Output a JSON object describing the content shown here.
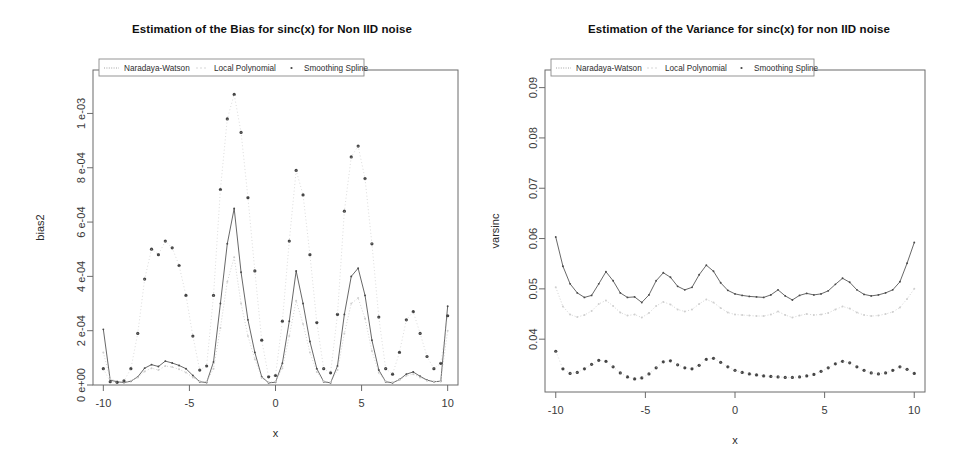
{
  "figure": {
    "background": "#ffffff",
    "panel_count": 2,
    "series_colors": {
      "naradaya_watson": "#4d4d4d",
      "local_polynomial": "#c8c8c8",
      "smoothing_spline": "#434343"
    }
  },
  "legend": {
    "entries": [
      {
        "label": "Naradaya-Watson",
        "glyph": "dotted-line",
        "key": "nw"
      },
      {
        "label": "Local Polynomial",
        "glyph": "faint-dashed-line",
        "key": "lp"
      },
      {
        "label": "Smoothing Spline",
        "glyph": "dot-marker",
        "key": "ss"
      }
    ],
    "position": "top-left-inside"
  },
  "chart_data": [
    {
      "id": "bias-plot",
      "type": "line",
      "title": "Estimation of the Bias for sinc(x) for Non IID noise",
      "xlabel": "x",
      "ylabel": "bias2",
      "xlim": [
        -10.6,
        10.6
      ],
      "ylim": [
        0,
        0.00116
      ],
      "grid": false,
      "xticks": [
        -10,
        -5,
        0,
        5,
        10
      ],
      "xticklabels": [
        "-10",
        "-5",
        "0",
        "5",
        "10"
      ],
      "yticks": [
        0,
        0.0002,
        0.0004,
        0.0006,
        0.0008,
        0.001
      ],
      "yticklabels": [
        "0 e+00",
        "2 e-04",
        "4 e-04",
        "6 e-04",
        "8 e-04",
        "1 e-03"
      ],
      "legend_position": "top-left",
      "x": [
        -10.0,
        -9.6,
        -9.2,
        -8.8,
        -8.4,
        -8.0,
        -7.6,
        -7.2,
        -6.8,
        -6.4,
        -6.0,
        -5.6,
        -5.2,
        -4.8,
        -4.4,
        -4.0,
        -3.6,
        -3.2,
        -2.8,
        -2.4,
        -2.0,
        -1.6,
        -1.2,
        -0.8,
        -0.4,
        0.0,
        0.4,
        0.8,
        1.2,
        1.6,
        2.0,
        2.4,
        2.8,
        3.2,
        3.6,
        4.0,
        4.4,
        4.8,
        5.2,
        5.6,
        6.0,
        6.4,
        6.8,
        7.2,
        7.6,
        8.0,
        8.4,
        8.8,
        9.2,
        9.6,
        10.0
      ],
      "series": [
        {
          "name": "Naradaya-Watson",
          "key": "nw",
          "style": "line-with-small-dots",
          "values": [
            0.000205,
            1.8e-05,
            1.2e-05,
            9e-06,
            1.4e-05,
            3e-05,
            6.2e-05,
            7.5e-05,
            6.8e-05,
            8.8e-05,
            8.1e-05,
            7.2e-05,
            6e-05,
            3.5e-05,
            1.2e-05,
            9e-06,
            8.5e-05,
            0.0003,
            0.00052,
            0.00065,
            0.000415,
            0.00024,
            0.00012,
            3e-05,
            8e-06,
            1e-05,
            8e-05,
            0.000235,
            0.00042,
            0.0003,
            0.00016,
            6e-05,
            1.2e-05,
            8e-06,
            7e-05,
            0.00026,
            0.0004,
            0.00043,
            0.00033,
            0.000165,
            5.5e-05,
            1.2e-05,
            8e-06,
            2e-05,
            4e-05,
            4.8e-05,
            3.2e-05,
            1.8e-05,
            1.2e-05,
            1.4e-05,
            0.00029
          ]
        },
        {
          "name": "Local Polynomial",
          "key": "lp",
          "style": "faint-dotted",
          "values": [
            0.00012,
            2.2e-05,
            1.4e-05,
            1e-05,
            1.6e-05,
            2.8e-05,
            5e-05,
            6.2e-05,
            5.5e-05,
            7e-05,
            6.6e-05,
            5.8e-05,
            4.6e-05,
            2.8e-05,
            1.4e-05,
            1.2e-05,
            6e-05,
            0.00021,
            0.00038,
            0.00047,
            0.0003,
            0.00018,
            9.5e-05,
            2.6e-05,
            1e-05,
            1.2e-05,
            6.2e-05,
            0.00018,
            0.00031,
            0.000225,
            0.00012,
            4.8e-05,
            1.4e-05,
            1e-05,
            5.5e-05,
            0.00019,
            0.0003,
            0.00032,
            0.000245,
            0.000125,
            4.5e-05,
            1.4e-05,
            1e-05,
            1.8e-05,
            3.4e-05,
            4e-05,
            2.8e-05,
            1.6e-05,
            1.2e-05,
            1.4e-05,
            0.0002
          ]
        },
        {
          "name": "Smoothing Spline",
          "key": "ss",
          "style": "large-dots",
          "values": [
            6e-05,
            1.2e-05,
            1e-05,
            1.5e-05,
            6e-05,
            0.00019,
            0.00039,
            0.0005,
            0.00048,
            0.00053,
            0.000505,
            0.00044,
            0.00033,
            0.00018,
            5.5e-05,
            7e-05,
            0.00033,
            0.00072,
            0.00098,
            0.00107,
            0.00093,
            0.00069,
            0.00042,
            0.000165,
            3e-05,
            3.5e-05,
            0.000235,
            0.00053,
            0.00079,
            0.0007,
            0.00048,
            0.00023,
            6e-05,
            4.5e-05,
            0.00026,
            0.00064,
            0.00084,
            0.00088,
            0.00076,
            0.00052,
            0.00025,
            6e-05,
            4e-05,
            0.00012,
            0.00024,
            0.00027,
            0.00019,
            0.000105,
            6e-05,
            8e-05,
            0.000255
          ]
        }
      ]
    },
    {
      "id": "variance-plot",
      "type": "line",
      "title": "Estimation of the Variance for sinc(x) for non IID noise",
      "xlabel": "x",
      "ylabel": "varsinc",
      "xlim": [
        -10.6,
        10.6
      ],
      "ylim": [
        0.0295,
        0.0935
      ],
      "grid": false,
      "xticks": [
        -10,
        -5,
        0,
        5,
        10
      ],
      "xticklabels": [
        "-10",
        "-5",
        "0",
        "5",
        "10"
      ],
      "yticks": [
        0.04,
        0.05,
        0.06,
        0.07,
        0.08,
        0.09
      ],
      "yticklabels": [
        "0.04",
        "0.05",
        "0.06",
        "0.07",
        "0.08",
        "0.09"
      ],
      "legend_position": "top-left",
      "x": [
        -10.0,
        -9.6,
        -9.2,
        -8.8,
        -8.4,
        -8.0,
        -7.6,
        -7.2,
        -6.8,
        -6.4,
        -6.0,
        -5.6,
        -5.2,
        -4.8,
        -4.4,
        -4.0,
        -3.6,
        -3.2,
        -2.8,
        -2.4,
        -2.0,
        -1.6,
        -1.2,
        -0.8,
        -0.4,
        0.0,
        0.4,
        0.8,
        1.2,
        1.6,
        2.0,
        2.4,
        2.8,
        3.2,
        3.6,
        4.0,
        4.4,
        4.8,
        5.2,
        5.6,
        6.0,
        6.4,
        6.8,
        7.2,
        7.6,
        8.0,
        8.4,
        8.8,
        9.2,
        9.6,
        10.0
      ],
      "series": [
        {
          "name": "Naradaya-Watson",
          "key": "nw",
          "style": "line-with-small-dots",
          "values": [
            0.0603,
            0.0545,
            0.051,
            0.0492,
            0.0483,
            0.0487,
            0.051,
            0.0534,
            0.0516,
            0.0492,
            0.0483,
            0.0484,
            0.0473,
            0.0488,
            0.0516,
            0.0532,
            0.0523,
            0.0505,
            0.0498,
            0.0503,
            0.0528,
            0.0547,
            0.0535,
            0.0512,
            0.0497,
            0.049,
            0.0487,
            0.0485,
            0.0484,
            0.0483,
            0.0488,
            0.0498,
            0.0486,
            0.0478,
            0.0487,
            0.0491,
            0.0488,
            0.049,
            0.0496,
            0.0509,
            0.0521,
            0.0513,
            0.0498,
            0.0489,
            0.0486,
            0.0488,
            0.0492,
            0.0498,
            0.0514,
            0.0551,
            0.0592
          ]
        },
        {
          "name": "Local Polynomial",
          "key": "lp",
          "style": "faint-dotted",
          "values": [
            0.0503,
            0.0465,
            0.0449,
            0.0444,
            0.0448,
            0.0456,
            0.047,
            0.0477,
            0.0466,
            0.0453,
            0.0447,
            0.0449,
            0.0443,
            0.0452,
            0.0466,
            0.0474,
            0.0469,
            0.0459,
            0.0455,
            0.0459,
            0.047,
            0.0479,
            0.0473,
            0.0462,
            0.0453,
            0.0449,
            0.0448,
            0.0447,
            0.0446,
            0.0446,
            0.0449,
            0.0455,
            0.0448,
            0.0443,
            0.0447,
            0.045,
            0.0448,
            0.0449,
            0.0452,
            0.0459,
            0.0465,
            0.0461,
            0.0453,
            0.0448,
            0.0446,
            0.0447,
            0.045,
            0.0454,
            0.0463,
            0.048,
            0.05
          ]
        },
        {
          "name": "Smoothing Spline",
          "key": "ss",
          "style": "large-dots",
          "values": [
            0.0376,
            0.0341,
            0.0332,
            0.0334,
            0.0341,
            0.035,
            0.0358,
            0.0356,
            0.0345,
            0.0333,
            0.0325,
            0.0321,
            0.0323,
            0.0331,
            0.0343,
            0.0355,
            0.0357,
            0.0349,
            0.0343,
            0.0341,
            0.0348,
            0.036,
            0.0362,
            0.0354,
            0.0345,
            0.0338,
            0.0334,
            0.0331,
            0.0329,
            0.0327,
            0.0326,
            0.0325,
            0.0324,
            0.0324,
            0.0325,
            0.0327,
            0.033,
            0.0336,
            0.0343,
            0.0351,
            0.0356,
            0.0353,
            0.0345,
            0.0338,
            0.0333,
            0.0331,
            0.0333,
            0.0338,
            0.0345,
            0.034,
            0.0332
          ]
        }
      ]
    }
  ]
}
